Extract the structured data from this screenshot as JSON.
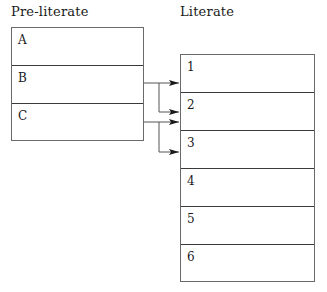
{
  "diagram": {
    "columns": [
      {
        "title": "Pre-literate",
        "cells": [
          "A",
          "B",
          "C"
        ]
      },
      {
        "title": "Literate",
        "cells": [
          "1",
          "2",
          "3",
          "4",
          "5",
          "6"
        ]
      }
    ],
    "connections": [
      {
        "from": "B",
        "to": [
          "1",
          "2"
        ]
      },
      {
        "from": "C",
        "to": [
          "2",
          "3"
        ]
      }
    ],
    "colors": {
      "line": "#555555",
      "border": "#6a6a6a",
      "divider": "#3a3a3a",
      "text": "#1a1a1a"
    }
  }
}
